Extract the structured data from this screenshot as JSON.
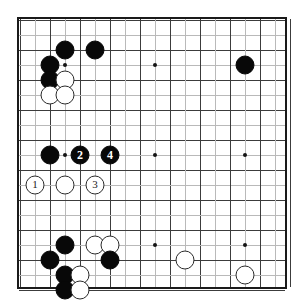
{
  "diagram": {
    "kind": "go-board-diagram",
    "board_size": 19,
    "grid_origin_x": 17,
    "grid_origin_y": 17,
    "grid_spacing": 15,
    "colors": {
      "board_background": "#ffffff",
      "grid_line": "#3c3c3c",
      "border": "#1a1a1a",
      "black_stone": "#080808",
      "white_stone": "#ffffff",
      "white_stone_outline": "#2a2a2a"
    },
    "star_points": [
      {
        "col": 3,
        "row": 3
      },
      {
        "col": 9,
        "row": 3
      },
      {
        "col": 15,
        "row": 3
      },
      {
        "col": 3,
        "row": 9
      },
      {
        "col": 9,
        "row": 9
      },
      {
        "col": 15,
        "row": 9
      },
      {
        "col": 3,
        "row": 15
      },
      {
        "col": 9,
        "row": 15
      },
      {
        "col": 15,
        "row": 15
      }
    ],
    "moves": [
      {
        "n": 1,
        "color": "white",
        "col": 1,
        "row": 11,
        "label": "1"
      },
      {
        "n": 2,
        "color": "black",
        "col": 4,
        "row": 9,
        "label": "2"
      },
      {
        "n": 3,
        "color": "white",
        "col": 5,
        "row": 11,
        "label": "3"
      },
      {
        "n": 4,
        "color": "black",
        "col": 6,
        "row": 9,
        "label": "4"
      }
    ],
    "stones": [
      {
        "color": "black",
        "col": 3,
        "row": 2
      },
      {
        "color": "black",
        "col": 5,
        "row": 2
      },
      {
        "color": "black",
        "col": 15,
        "row": 3
      },
      {
        "color": "black",
        "col": 2,
        "row": 3
      },
      {
        "color": "black",
        "col": 2,
        "row": 4
      },
      {
        "color": "white",
        "col": 3,
        "row": 4
      },
      {
        "color": "white",
        "col": 2,
        "row": 5
      },
      {
        "color": "white",
        "col": 3,
        "row": 5
      },
      {
        "color": "black",
        "col": 2,
        "row": 9
      },
      {
        "color": "white",
        "col": 3,
        "row": 11
      },
      {
        "color": "black",
        "col": 3,
        "row": 15
      },
      {
        "color": "white",
        "col": 5,
        "row": 15
      },
      {
        "color": "white",
        "col": 6,
        "row": 15
      },
      {
        "color": "black",
        "col": 2,
        "row": 16
      },
      {
        "color": "black",
        "col": 6,
        "row": 16
      },
      {
        "color": "white",
        "col": 11,
        "row": 16
      },
      {
        "color": "black",
        "col": 3,
        "row": 17
      },
      {
        "color": "white",
        "col": 4,
        "row": 17
      },
      {
        "color": "white",
        "col": 15,
        "row": 17
      },
      {
        "color": "black",
        "col": 3,
        "row": 18
      },
      {
        "color": "white",
        "col": 4,
        "row": 18
      }
    ]
  }
}
